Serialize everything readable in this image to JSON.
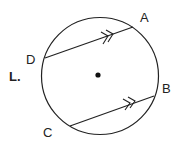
{
  "problem_label": "L.",
  "points": {
    "A": "A",
    "B": "B",
    "C": "C",
    "D": "D"
  },
  "colors": {
    "stroke": "#222222",
    "background": "#ffffff"
  }
}
